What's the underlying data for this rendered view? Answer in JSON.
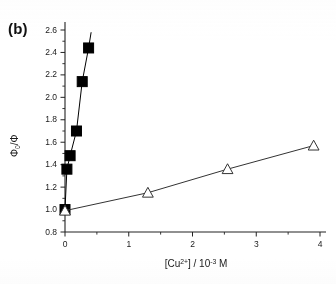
{
  "figure": {
    "panel_label": "(b)",
    "background_color": "#ffffff",
    "axis_color": "#222222",
    "series1_color": "#000000",
    "series2_color": "#333333"
  },
  "chart_data": {
    "type": "scatter",
    "title": "",
    "subtitle": "",
    "panel": "(b)",
    "xlabel": "[Cu2+] / 10-3 M",
    "xlabel_parts": {
      "bracket_open": "[Cu",
      "charge": "2+",
      "bracket_close": "] / 10",
      "exponent": "-3",
      "unit": " M"
    },
    "ylabel": "phi0/phi",
    "ylabel_parts": {
      "numerator": "Φ",
      "numerator_sub": "0",
      "slash": "/",
      "denominator": "Φ"
    },
    "xlim": [
      0,
      4
    ],
    "ylim": [
      0.8,
      2.6
    ],
    "xticks": [
      0,
      1,
      2,
      3,
      4
    ],
    "xtick_labels": [
      "0",
      "1",
      "2",
      "3",
      "4"
    ],
    "xminor_ticks": [
      0.5,
      1.5,
      2.5,
      3.5
    ],
    "yticks": [
      0.8,
      1.0,
      1.2,
      1.4,
      1.6,
      1.8,
      2.0,
      2.2,
      2.4,
      2.6
    ],
    "ytick_labels": [
      "0.8",
      "1.0",
      "1.2",
      "1.4",
      "1.6",
      "1.8",
      "2.0",
      "2.2",
      "2.4",
      "2.6"
    ],
    "grid": false,
    "legend": false,
    "legend_position": "none",
    "spines": [
      "left",
      "bottom"
    ],
    "tick_direction": "out",
    "series": [
      {
        "name": "steep-quenching-series",
        "marker": "filled-square",
        "marker_color": "#000000",
        "line": true,
        "x": [
          0.0,
          0.03,
          0.08,
          0.18,
          0.27,
          0.37
        ],
        "y": [
          1.0,
          1.36,
          1.48,
          1.7,
          2.14,
          2.44
        ],
        "fit_extend_to": {
          "x": 0.41,
          "y": 2.58
        }
      },
      {
        "name": "shallow-quenching-series",
        "marker": "open-triangle",
        "marker_color": "#333333",
        "line": true,
        "x": [
          0.0,
          1.3,
          2.55,
          3.9
        ],
        "y": [
          0.99,
          1.15,
          1.36,
          1.57
        ]
      }
    ]
  }
}
